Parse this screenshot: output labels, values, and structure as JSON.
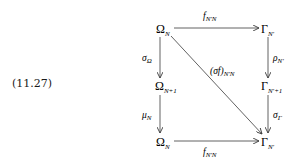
{
  "equation_number": "(11.27)",
  "nodes": {
    "top_left": {
      "base": "Ω",
      "sub": "N"
    },
    "top_right": {
      "base": "Γ",
      "sub": "N′"
    },
    "mid_left": {
      "base": "Ω",
      "sub": "N+1"
    },
    "mid_right": {
      "base": "Γ",
      "sub": "N′+1"
    },
    "bottom_left": {
      "base": "Ω",
      "sub": "N"
    },
    "bottom_right": {
      "base": "Γ",
      "sub": "N′"
    }
  },
  "arrows": {
    "top": {
      "base": "f",
      "sub": "N′N"
    },
    "bottom": {
      "base": "f",
      "sub": "N′N"
    },
    "diagonal": {
      "base": "(σf)",
      "sub": "N′N"
    },
    "left_upper": {
      "base": "σ",
      "sub": "Ω"
    },
    "left_lower": {
      "base": "μ",
      "sub": "N"
    },
    "right_upper": {
      "base": "ρ",
      "sub": "N′"
    },
    "right_lower": {
      "base": "σ",
      "sub": "Γ"
    }
  },
  "colors": {
    "ink": "#1a1a1a",
    "arrow": "#3a3a3a",
    "background": "#ffffff"
  }
}
